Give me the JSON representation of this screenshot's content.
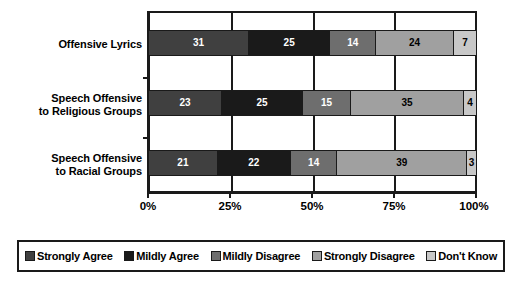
{
  "chart_data": {
    "type": "bar",
    "orientation": "horizontal",
    "stacked": true,
    "stacked_mode": "percent",
    "title": "",
    "subtitle": "",
    "xlabel": "",
    "ylabel": "",
    "xlim": [
      0,
      100
    ],
    "xticks": [
      0,
      25,
      50,
      75,
      100
    ],
    "xticklabels": [
      "0%",
      "25%",
      "50%",
      "75%",
      "100%"
    ],
    "grid": true,
    "legend_position": "bottom",
    "categories": [
      "Offensive Lyrics",
      "Speech Offensive to Religious Groups",
      "Speech Offensive to Racial Groups"
    ],
    "category_lines": [
      [
        "Offensive Lyrics"
      ],
      [
        "Speech Offensive",
        "to Religious Groups"
      ],
      [
        "Speech Offensive",
        "to Racial Groups"
      ]
    ],
    "series": [
      {
        "name": "Strongly Agree",
        "color": "#404040",
        "label_color": "#ffffff",
        "values": [
          31,
          23,
          21
        ]
      },
      {
        "name": "Mildly Agree",
        "color": "#1a1a1a",
        "label_color": "#ffffff",
        "values": [
          25,
          25,
          22
        ]
      },
      {
        "name": "Mildly Disagree",
        "color": "#6e6e6e",
        "label_color": "#ffffff",
        "values": [
          14,
          15,
          14
        ]
      },
      {
        "name": "Strongly Disagree",
        "color": "#a0a0a0",
        "label_color": "#000000",
        "values": [
          24,
          35,
          39
        ]
      },
      {
        "name": "Don't Know",
        "color": "#c8c8c8",
        "label_color": "#000000",
        "values": [
          7,
          4,
          3
        ]
      }
    ],
    "legend_entries": [
      {
        "label": "Strongly Agree",
        "color": "#404040"
      },
      {
        "label": "Mildly Agree",
        "color": "#1a1a1a"
      },
      {
        "label": "Mildly Disagree",
        "color": "#6e6e6e"
      },
      {
        "label": "Strongly Disagree",
        "color": "#a0a0a0"
      },
      {
        "label": "Don't Know",
        "color": "#c8c8c8"
      }
    ],
    "axis_color": "#1a1a1a",
    "background_color": "#ffffff"
  }
}
